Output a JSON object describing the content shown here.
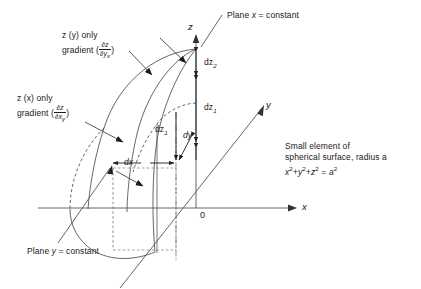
{
  "figure": {
    "background": "#ffffff",
    "line_color": "#4d4d4d",
    "text_color": "#1a1a1a",
    "width": 421,
    "height": 289
  },
  "axes": {
    "x_label": "x",
    "y_label": "y",
    "z_label": "z",
    "origin_label": "0"
  },
  "annotations": {
    "plane_x": "Plane x = constant",
    "plane_y": "Plane y = constant",
    "grad_y_line1": "z (y) only",
    "grad_y_line2_prefix": "gradient (",
    "grad_y_num": "∂z",
    "grad_y_den": "∂y",
    "grad_y_den_sub": "x",
    "grad_y_line2_suffix": ")",
    "grad_x_line1": "z (x) only",
    "grad_x_line2_prefix": "gradient (",
    "grad_x_num": "∂z",
    "grad_x_den": "∂x",
    "grad_x_den_sub": "y",
    "grad_x_line2_suffix": ")",
    "note_line1": "Small element of",
    "note_line2": "spherical surface, radius a",
    "note_eq_x": "x",
    "note_eq_plus1": "+",
    "note_eq_y": "y",
    "note_eq_plus2": "+",
    "note_eq_z": "z",
    "note_eq_equals": " = ",
    "note_eq_a": "a",
    "note_exp": "2"
  },
  "measures": {
    "dz2": "dz",
    "dz2_sub": "2",
    "dz1_right": "dz",
    "dz1_right_sub": "1",
    "dz1_mid": "dz",
    "dz1_mid_sub": "1",
    "dx": "dx",
    "dy": "dy"
  }
}
